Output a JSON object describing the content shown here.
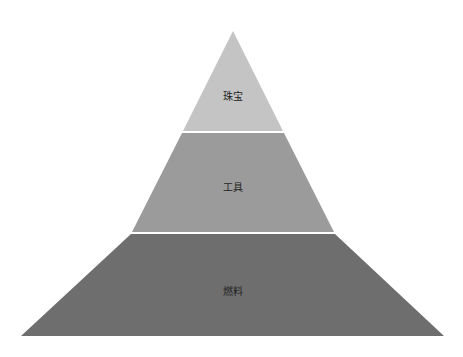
{
  "diagram": {
    "type": "pyramid",
    "tiers": [
      {
        "label": "珠宝",
        "color": "#c4c4c4"
      },
      {
        "label": "工具",
        "color": "#9b9b9b"
      },
      {
        "label": "燃料",
        "color": "#6e6e6e"
      }
    ],
    "divider_color": "#ffffff"
  }
}
